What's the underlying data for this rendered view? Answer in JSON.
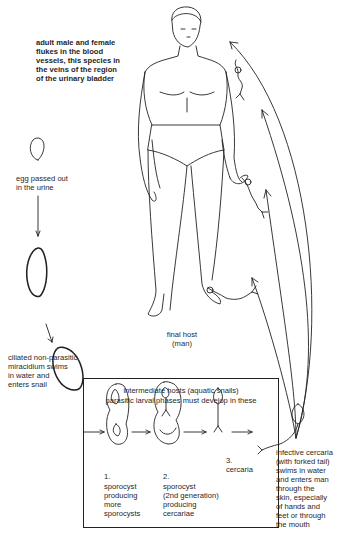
{
  "diagram": {
    "labels": {
      "adult_flukes": "adult male and female\nflukes in the blood\nvessels, this species in\nthe veins of the region\nof the urinary bladder",
      "egg": "egg passed out\nin the urine",
      "miracidium": "ciliated non-parasitic\nmiracidium swims\nin water and\nenters snail",
      "final_host": "final host\n(man)",
      "intermediate_title_1": "intermediate hosts (aquatic snails)",
      "intermediate_title_2": "parasitic larval phases must develop in these",
      "stage1_num": "1.",
      "stage1_text": "sporocyst\nproducing\nmore\nsporocysts",
      "stage2_num": "2.",
      "stage2_text": "sporocyst\n(2nd generation)\nproducing\ncercariae",
      "stage3": "3.\ncercaria",
      "infective": "infective cercaria\n(with forked tail)\nswims in water\nand enters man\nthrough the\nskin, especially\nof hands and\nfeet or through\nthe mouth"
    },
    "colors": {
      "ink": "#1f1f1f",
      "background": "#ffffff"
    }
  }
}
